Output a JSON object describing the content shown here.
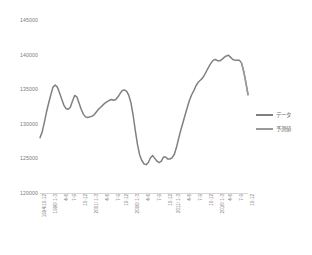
{
  "chart_data": {
    "type": "line",
    "title": "",
    "subtitle": "",
    "xlabel": "",
    "ylabel": "",
    "ylim": [
      120000,
      145000
    ],
    "ytick_labels": [
      "145000",
      "140000",
      "135000",
      "130000",
      "125000",
      "120000"
    ],
    "ytick_values": [
      145000,
      140000,
      135000,
      130000,
      125000,
      120000
    ],
    "grid": false,
    "legend_position": "right",
    "legend": [
      "データ",
      "予測値"
    ],
    "xtick_labels": [
      "1994/10-12",
      "1996/ 1-3",
      "4-6",
      "7-9",
      "10-12",
      "2001/ 1-3",
      "4-6",
      "7-9",
      "10-12",
      "2006/ 1-3",
      "4-6",
      "7-9",
      "10-12",
      "2011/ 1-3",
      "4-6",
      "7-9",
      "10-12",
      "2016/ 1-3",
      "4-6",
      "7-9",
      "10-12"
    ],
    "x": [
      "1994/10-12",
      "1995/1-3",
      "1995/4-6",
      "1995/7-9",
      "1995/10-12",
      "1996/1-3",
      "1996/4-6",
      "1996/7-9",
      "1996/10-12",
      "1997/1-3",
      "1997/4-6",
      "1997/7-9",
      "1997/10-12",
      "1998/1-3",
      "1998/4-6",
      "1998/7-9",
      "1998/10-12",
      "1999/1-3",
      "1999/4-6",
      "1999/7-9",
      "1999/10-12",
      "2000/1-3",
      "2000/4-6",
      "2000/7-9",
      "2000/10-12",
      "2001/1-3",
      "2001/4-6",
      "2001/7-9",
      "2001/10-12",
      "2002/1-3",
      "2002/4-6",
      "2002/7-9",
      "2002/10-12",
      "2003/1-3",
      "2003/4-6",
      "2003/7-9",
      "2003/10-12",
      "2004/1-3",
      "2004/4-6",
      "2004/7-9",
      "2004/10-12",
      "2005/1-3",
      "2005/4-6",
      "2005/7-9",
      "2005/10-12",
      "2006/1-3",
      "2006/4-6",
      "2006/7-9",
      "2006/10-12",
      "2007/1-3",
      "2007/4-6",
      "2007/7-9",
      "2007/10-12",
      "2008/1-3",
      "2008/4-6",
      "2008/7-9",
      "2008/10-12",
      "2009/1-3",
      "2009/4-6",
      "2009/7-9",
      "2009/10-12",
      "2010/1-3",
      "2010/4-6",
      "2010/7-9",
      "2010/10-12",
      "2011/1-3",
      "2011/4-6",
      "2011/7-9",
      "2011/10-12",
      "2012/1-3",
      "2012/4-6",
      "2012/7-9",
      "2012/10-12",
      "2013/1-3",
      "2013/4-6",
      "2013/7-9",
      "2013/10-12",
      "2014/1-3",
      "2014/4-6",
      "2014/7-9",
      "2014/10-12",
      "2015/1-3",
      "2015/4-6",
      "2015/7-9",
      "2015/10-12",
      "2016/1-3",
      "2016/4-6",
      "2016/7-9",
      "2016/10-12",
      "2017/1-3",
      "2017/4-6",
      "2017/7-9",
      "2017/10-12",
      "2018/1-3",
      "2018/4-6",
      "2018/7-9",
      "2018/10-12"
    ],
    "series": [
      {
        "name": "データ",
        "color": "#808080",
        "values": [
          128000,
          128800,
          130200,
          131700,
          133000,
          134200,
          135300,
          135600,
          135300,
          134500,
          133600,
          132700,
          132200,
          132100,
          132400,
          133300,
          134100,
          133900,
          133000,
          132100,
          131400,
          131000,
          130900,
          131000,
          131100,
          131300,
          131700,
          132100,
          132400,
          132700,
          133000,
          133200,
          133400,
          133500,
          133400,
          133500,
          133900,
          134400,
          134800,
          134900,
          134700,
          134100,
          133000,
          131200,
          129000,
          127000,
          125500,
          124700,
          124200,
          124100,
          124400,
          125100,
          125400,
          125000,
          124600,
          124400,
          124600,
          125200,
          125200,
          124900,
          124900,
          125100,
          125600,
          126600,
          127900,
          129100,
          130200,
          131300,
          132400,
          133400,
          134200,
          134800,
          135500,
          136000,
          136300,
          136600,
          137100,
          137700,
          138300,
          138800,
          139200,
          139300,
          139100,
          139100,
          139300,
          139600,
          139800,
          139900,
          139600,
          139300,
          139200,
          139200,
          139200,
          138800,
          137600,
          136000,
          134200
        ]
      },
      {
        "name": "予測値",
        "color": "#9a9a9a",
        "values": [
          null,
          null,
          null,
          null,
          null,
          null,
          null,
          null,
          null,
          null,
          null,
          null,
          null,
          null,
          null,
          null,
          null,
          null,
          null,
          null,
          null,
          null,
          null,
          null,
          null,
          null,
          null,
          null,
          null,
          null,
          null,
          null,
          null,
          null,
          null,
          null,
          null,
          null,
          null,
          null,
          null,
          null,
          null,
          null,
          null,
          null,
          null,
          null,
          null,
          null,
          null,
          null,
          null,
          null,
          null,
          null,
          null,
          null,
          null,
          null,
          null,
          null,
          null,
          null,
          null,
          null,
          null,
          null,
          null,
          null,
          null,
          null,
          null,
          null,
          null,
          null,
          null,
          null,
          null,
          null,
          null,
          null,
          null,
          null,
          null,
          null,
          null,
          null,
          null,
          null,
          null,
          null,
          null,
          138800,
          137600,
          136000,
          134200
        ]
      }
    ]
  }
}
